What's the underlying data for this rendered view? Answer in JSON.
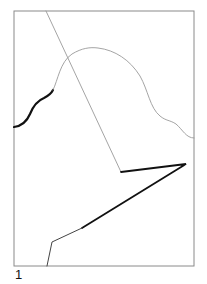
{
  "figure": {
    "label": "1",
    "frame": {
      "x": 14,
      "y": 11,
      "width": 180,
      "height": 255,
      "stroke": "#8a8a8a"
    },
    "paths": [
      {
        "name": "curve-thick-start",
        "d": "M14,127 C22,126 27,121 30,114 C34,104 39,100 44,98 C48,96 51,94 53,90",
        "stroke": "#111111",
        "width": 2.2
      },
      {
        "name": "curve-thin",
        "d": "M53,90 C58,80 60,62 72,54 C82,48 90,47 98,48 C115,50 130,60 140,76 C148,90 150,108 160,116 C166,121 170,120 176,124 C183,130 186,138 194,138",
        "stroke": "#9a9a9a",
        "width": 0.9
      },
      {
        "name": "diagonal-thin",
        "d": "M46,11 L121,172",
        "stroke": "#9a9a9a",
        "width": 0.9
      },
      {
        "name": "polyline-thick",
        "d": "M121,172 L186,164 L82,228",
        "stroke": "#111111",
        "width": 1.8
      },
      {
        "name": "polyline-tail",
        "d": "M82,228 L52,242 L47,266",
        "stroke": "#444444",
        "width": 1.0
      }
    ]
  }
}
